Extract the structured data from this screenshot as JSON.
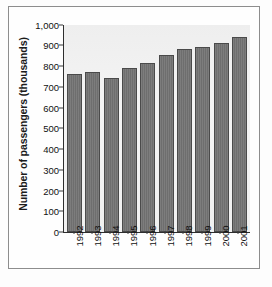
{
  "chart_data": {
    "type": "bar",
    "title": "",
    "xlabel": "",
    "ylabel": "Number of passengers (thousands)",
    "categories": [
      "1992",
      "1993",
      "1994",
      "1995",
      "1996",
      "1997",
      "1998",
      "1999",
      "2000",
      "2001"
    ],
    "values": [
      760,
      770,
      740,
      790,
      815,
      855,
      880,
      893,
      912,
      940
    ],
    "ylim": [
      0,
      1000
    ],
    "ytick_labels": [
      "1,000",
      "900",
      "800",
      "700",
      "600",
      "500",
      "400",
      "300",
      "200",
      "100",
      "0"
    ],
    "ytick_values": [
      1000,
      900,
      800,
      700,
      600,
      500,
      400,
      300,
      200,
      100,
      0
    ],
    "grid": false,
    "legend": null,
    "bar_color": "#6e6e6e",
    "bar_edge_color": "#4a4a4a",
    "plot_background": "#f1f1f1",
    "axis_color": "#2e2e2e",
    "frame_color": "#8d8d8d"
  }
}
